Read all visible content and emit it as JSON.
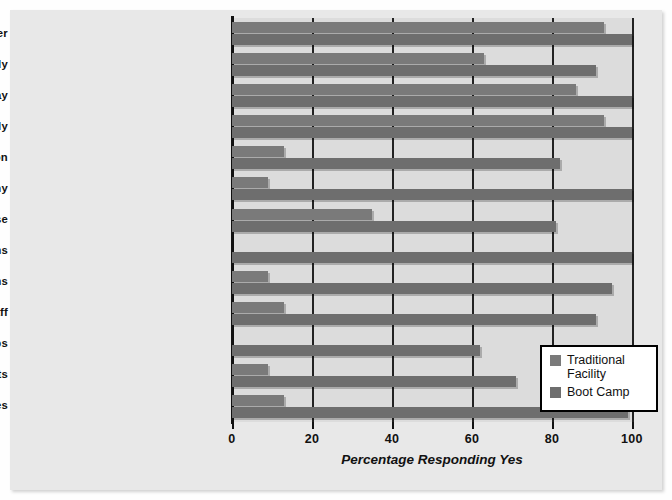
{
  "chart_data": {
    "type": "bar",
    "orientation": "horizontal",
    "title": "",
    "xlabel": "Percentage Responding Yes",
    "ylabel": "",
    "xlim": [
      0,
      100
    ],
    "xticks": [
      0,
      20,
      40,
      60,
      80,
      100
    ],
    "xtick_labels": [
      "0",
      "20",
      "40",
      "60",
      "80",
      "100"
    ],
    "grid": true,
    "legend_position": "lower-right",
    "categories": [
      "Set time for daily shower",
      "Set time for daily study",
      "Get up at same time each day",
      "Beds inspected daily",
      "Formal graduation",
      "Drill and ceremony",
      "Challenge/adventure/ropes course",
      "Juveniles wear military uniforms",
      "Staff wear military uniforms",
      "Military titles for staff",
      "Enter in groups",
      "Summary punishments",
      "March to activities"
    ],
    "series": [
      {
        "name": "Traditional Facility",
        "color": "#7a7a7a",
        "values": [
          93,
          63,
          86,
          93,
          13,
          9,
          35,
          0,
          9,
          13,
          0,
          9,
          13
        ]
      },
      {
        "name": "Boot Camp",
        "color": "#6e6e6e",
        "values": [
          100,
          91,
          100,
          100,
          82,
          100,
          81,
          100,
          95,
          91,
          62,
          71,
          99
        ]
      }
    ]
  },
  "legend": {
    "items": [
      {
        "label": "Traditional Facility",
        "swatch": "trad"
      },
      {
        "label": "Boot Camp",
        "swatch": "boot"
      }
    ]
  }
}
